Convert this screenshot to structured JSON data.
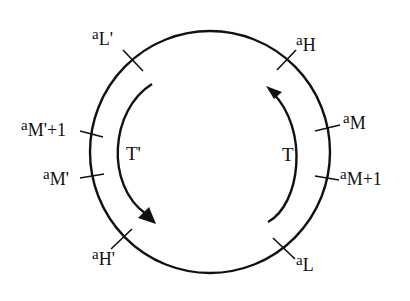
{
  "diagram": {
    "circle": {
      "cx": 210,
      "cy": 152,
      "rx": 120,
      "ry": 121,
      "stroke": "#111111"
    },
    "ticks": [
      {
        "id": "aLp",
        "x": 131,
        "y": 59
      },
      {
        "id": "aH",
        "x": 287,
        "y": 59
      },
      {
        "id": "aMp1",
        "x": 92,
        "y": 135
      },
      {
        "id": "aM",
        "x": 328,
        "y": 128
      },
      {
        "id": "aMp",
        "x": 92,
        "y": 175
      },
      {
        "id": "aM1",
        "x": 328,
        "y": 178
      },
      {
        "id": "aHp",
        "x": 122,
        "y": 238
      },
      {
        "id": "aL",
        "x": 284,
        "y": 249
      }
    ],
    "labels": {
      "aLp": {
        "base": "a",
        "sub": "L'"
      },
      "aH": {
        "base": "a",
        "sub": "H"
      },
      "aMp1": {
        "base": "a",
        "sub": "M'+1"
      },
      "aM": {
        "base": "a",
        "sub": "M"
      },
      "aMp": {
        "base": "a",
        "sub": "M'"
      },
      "aM1": {
        "base": "a",
        "sub": "M+1"
      },
      "aHp": {
        "base": "a",
        "sub": "H'"
      },
      "aL": {
        "base": "a",
        "sub": "L"
      }
    },
    "arrows": {
      "T": {
        "label": "T",
        "direction": "counter-clockwise (upward)"
      },
      "Tp": {
        "label": "T'",
        "direction": "counter-clockwise (downward)"
      }
    }
  }
}
